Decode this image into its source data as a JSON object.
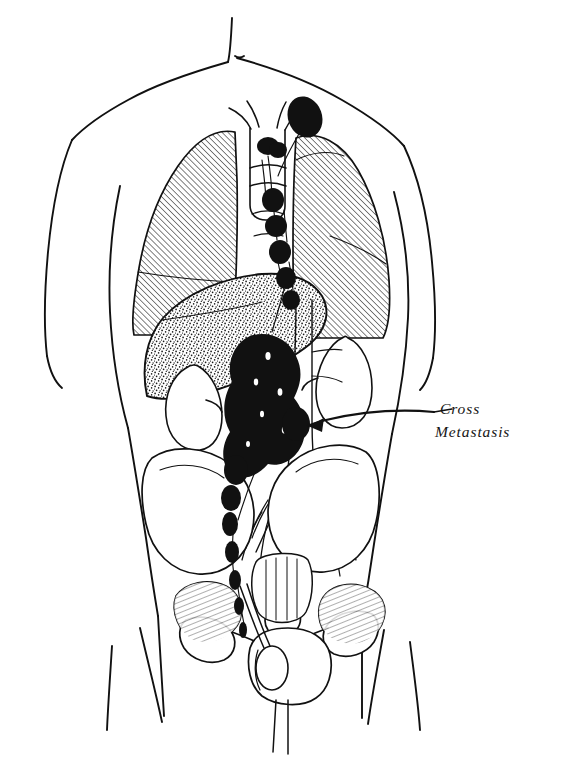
{
  "figure": {
    "type": "anatomical-line-drawing",
    "background_color": "#ffffff",
    "ink_color": "#111111",
    "width": 561,
    "height": 757
  },
  "annotations": [
    {
      "id": "cross-metastasis",
      "line1": "Cross",
      "line2": "Metastasis",
      "text": "Cross Metastasis",
      "x": 440,
      "y": 414,
      "points_to": "right-iliac-lymph-node",
      "leader": "arrow pointing left"
    }
  ],
  "structures": [
    {
      "name": "body-outline",
      "label": "Torso outline",
      "fill": "none",
      "stroke": "#111111"
    },
    {
      "name": "neck",
      "label": "Neck",
      "fill": "none"
    },
    {
      "name": "left-shoulder-arm",
      "label": "Left shoulder and arm",
      "fill": "none"
    },
    {
      "name": "right-shoulder-arm",
      "label": "Right shoulder and arm",
      "fill": "none"
    },
    {
      "name": "left-lung",
      "label": "Left lung",
      "texture": "diagonal-hatch",
      "fill": "#ffffff"
    },
    {
      "name": "right-lung",
      "label": "Right lung",
      "texture": "diagonal-hatch",
      "fill": "#ffffff"
    },
    {
      "name": "trachea",
      "label": "Trachea",
      "fill": "none"
    },
    {
      "name": "bronchi",
      "label": "Main bronchi",
      "fill": "none"
    },
    {
      "name": "liver",
      "label": "Liver",
      "texture": "stipple",
      "fill": "#ffffff"
    },
    {
      "name": "left-kidney",
      "label": "Left kidney",
      "fill": "#ffffff"
    },
    {
      "name": "right-kidney",
      "label": "Right kidney",
      "fill": "#ffffff"
    },
    {
      "name": "aorta",
      "label": "Abdominal aorta",
      "fill": "none"
    },
    {
      "name": "pelvis",
      "label": "Bony pelvis",
      "fill": "#ffffff"
    },
    {
      "name": "sacrum",
      "label": "Sacrum",
      "fill": "#ffffff"
    },
    {
      "name": "left-ilium",
      "label": "Left iliac bone",
      "fill": "#ffffff"
    },
    {
      "name": "right-ilium",
      "label": "Right iliac bone",
      "fill": "#ffffff"
    },
    {
      "name": "pubic-symphysis",
      "label": "Pubic symphysis",
      "fill": "#ffffff"
    },
    {
      "name": "scrotum",
      "label": "Scrotum",
      "fill": "#ffffff"
    },
    {
      "name": "left-testis",
      "label": "Left testis (primary site)",
      "fill": "#ffffff"
    },
    {
      "name": "spermatic-cord",
      "label": "Spermatic cord lymphatics",
      "fill": "none"
    },
    {
      "name": "thighs",
      "label": "Thighs",
      "fill": "none"
    }
  ],
  "lymphatics": {
    "label": "Involved lymph node chain",
    "fill_color": "#111111",
    "description": "Solid black nodes marking metastatic spread",
    "nodes": [
      {
        "name": "supraclavicular-node",
        "label": "Left supraclavicular node",
        "cx": 305,
        "cy": 117,
        "rx": 17,
        "ry": 21,
        "rot": -20
      },
      {
        "name": "paratracheal-node-1",
        "label": "Paratracheal node",
        "cx": 268,
        "cy": 146,
        "rx": 11,
        "ry": 9,
        "rot": 0
      },
      {
        "name": "hilar-node-1",
        "label": "Hilar node",
        "cx": 276,
        "cy": 173,
        "rx": 9,
        "ry": 8,
        "rot": 0
      },
      {
        "name": "mediastinal-node-1",
        "label": "Mediastinal node",
        "cx": 273,
        "cy": 200,
        "rx": 11,
        "ry": 12,
        "rot": 0
      },
      {
        "name": "mediastinal-node-2",
        "label": "Mediastinal node",
        "cx": 276,
        "cy": 226,
        "rx": 11,
        "ry": 11,
        "rot": 0
      },
      {
        "name": "mediastinal-node-3",
        "label": "Mediastinal node",
        "cx": 280,
        "cy": 252,
        "rx": 11,
        "ry": 12,
        "rot": 0
      },
      {
        "name": "mediastinal-node-4",
        "label": "Lower mediastinal node",
        "cx": 285,
        "cy": 277,
        "rx": 10,
        "ry": 11,
        "rot": 0
      },
      {
        "name": "para-aortic-mass",
        "label": "Confluent para-aortic nodal mass",
        "cx": 265,
        "cy": 400,
        "rx": 42,
        "ry": 62,
        "rot": 0
      },
      {
        "name": "right-iliac-lymph-node",
        "label": "Right common iliac node (cross metastasis)",
        "cx": 296,
        "cy": 424,
        "rx": 14,
        "ry": 17,
        "rot": 0
      },
      {
        "name": "iliac-node-chain-1",
        "label": "Iliac node",
        "cx": 236,
        "cy": 470,
        "rx": 12,
        "ry": 15,
        "rot": 0
      },
      {
        "name": "iliac-node-chain-2",
        "label": "Iliac node",
        "cx": 231,
        "cy": 498,
        "rx": 10,
        "ry": 13,
        "rot": 0
      },
      {
        "name": "iliac-node-chain-3",
        "label": "Iliac node",
        "cx": 230,
        "cy": 524,
        "rx": 8,
        "ry": 12,
        "rot": 0
      },
      {
        "name": "inguinal-node-1",
        "label": "Inguinal node",
        "cx": 232,
        "cy": 552,
        "rx": 7,
        "ry": 11,
        "rot": 0
      },
      {
        "name": "inguinal-node-2",
        "label": "Inguinal node",
        "cx": 235,
        "cy": 580,
        "rx": 6,
        "ry": 10,
        "rot": 0
      }
    ]
  },
  "textures": {
    "lung_hatch": {
      "name": "diagonal-hatch",
      "angle_deg": -45,
      "spacing_px": 4.2,
      "stroke_width": 1.05
    },
    "liver_stipple": {
      "name": "stipple",
      "dot_radius_px": 0.85,
      "density": "medium"
    },
    "bone_hatch": {
      "name": "short-hatch",
      "angle_deg": 70,
      "spacing_px": 5
    }
  }
}
